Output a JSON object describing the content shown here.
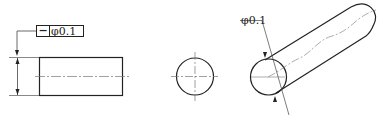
{
  "diagram": {
    "type": "engineering-drawing",
    "feature_control_frame": {
      "symbol": "−",
      "symbol_name": "straightness",
      "value": "φ0.1"
    },
    "views": {
      "front_view": {
        "shape": "rectangle",
        "centerline": true,
        "dimension_arrows": true
      },
      "side_view": {
        "shape": "circle",
        "centerlines": true
      },
      "isometric_view": {
        "shape": "cylinder",
        "wavy_axis": true
      }
    },
    "isometric_annotation": "φ0.1",
    "colors": {
      "line": "#222222",
      "centerline": "#777777",
      "background": "#ffffff"
    }
  }
}
